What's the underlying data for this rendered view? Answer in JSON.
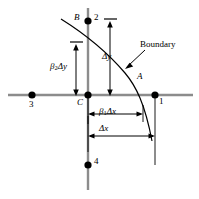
{
  "figure": {
    "title": "",
    "type": "finite-difference boundary stencil diagram",
    "colors": {
      "axis": "#808080",
      "ink": "#000000",
      "background": "#ffffff"
    },
    "nodes": [
      {
        "id": "node-1",
        "label": "1",
        "x": 155,
        "y": 95,
        "label_dx": 4,
        "label_dy": 3
      },
      {
        "id": "node-2",
        "label": "2",
        "x": 88,
        "y": 21,
        "label_dx": 5,
        "label_dy": -10
      },
      {
        "id": "node-3",
        "label": "3",
        "x": 32,
        "y": 95,
        "label_dx": -3,
        "label_dy": 4
      },
      {
        "id": "node-4",
        "label": "4",
        "x": 88,
        "y": 165,
        "label_dx": 5,
        "label_dy": -10
      },
      {
        "id": "node-c",
        "label": "C",
        "x": 88,
        "y": 95,
        "label_dx": -11,
        "label_dy": 2
      }
    ],
    "point_labels": [
      {
        "id": "label-a",
        "text": "A",
        "x": 138,
        "y": 78
      },
      {
        "id": "label-b",
        "text": "B",
        "x": 75,
        "y": 14
      }
    ],
    "annotations": {
      "boundary": "Boundary",
      "delta_y": "Δy",
      "delta_x": "Δx",
      "beta1_delta_x": {
        "beta": "β",
        "sub": "1",
        "delta": "Δx"
      },
      "beta2_delta_y": {
        "beta": "β",
        "sub": "2",
        "delta": "Δy"
      }
    },
    "axes": {
      "horizontal": {
        "x1": 8,
        "x2": 193,
        "y": 95
      },
      "vertical": {
        "x": 88,
        "y1": 8,
        "y2": 190
      }
    },
    "dimensions": [
      {
        "id": "dim-delta-y",
        "orientation": "vertical",
        "x": 110,
        "from": 21,
        "to": 95,
        "label": "Δy"
      },
      {
        "id": "dim-beta2-delta-y",
        "orientation": "vertical",
        "x": 76,
        "from": 44,
        "to": 95,
        "label": "β2Δy"
      },
      {
        "id": "dim-beta1-delta-x",
        "orientation": "horizontal",
        "y": 114,
        "from": 88,
        "to": 143,
        "label": "β1Δx"
      },
      {
        "id": "dim-delta-x",
        "orientation": "horizontal",
        "y": 136,
        "from": 88,
        "to": 155,
        "label": "Δx"
      }
    ]
  }
}
